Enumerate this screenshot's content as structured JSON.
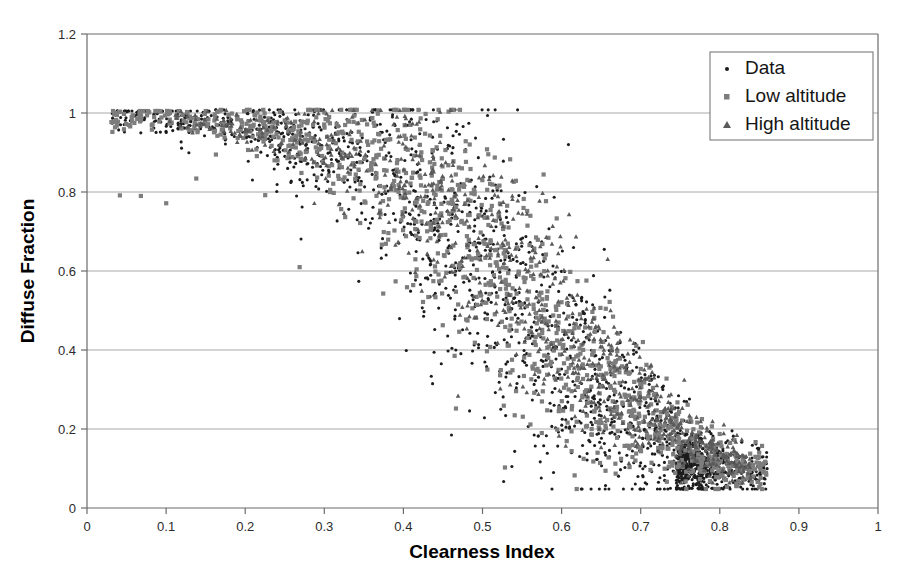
{
  "chart_data": {
    "type": "scatter",
    "title": "",
    "xlabel": "Clearness Index",
    "ylabel": "Diffuse Fraction",
    "xlim": [
      0,
      1
    ],
    "ylim": [
      0,
      1.2
    ],
    "xticks": [
      "0",
      "0.1",
      "0.2",
      "0.3",
      "0.4",
      "0.5",
      "0.6",
      "0.7",
      "0.8",
      "0.9",
      "1"
    ],
    "xtick_values": [
      0,
      0.1,
      0.2,
      0.3,
      0.4,
      0.5,
      0.6,
      0.7,
      0.8,
      0.9,
      1
    ],
    "yticks": [
      "0",
      "0.2",
      "0.4",
      "0.6",
      "0.8",
      "1",
      "1.2"
    ],
    "ytick_values": [
      0,
      0.2,
      0.4,
      0.6,
      0.8,
      1,
      1.2
    ],
    "grid": "horizontal",
    "legend_position": "top-right",
    "series": [
      {
        "name": "Data",
        "marker": "dot",
        "color": "#1c1c1c",
        "size": 3.1,
        "count": 1450,
        "description": "Measured hourly diffuse fraction versus clearness index; broad scatter band decaying from ~1.0 at low clearness index to ~0.08 at high clearness index.",
        "x_range": [
          0.03,
          0.86
        ],
        "y_range": [
          0.05,
          1.01
        ]
      },
      {
        "name": "Low altitude",
        "marker": "square",
        "color": "#7d7d7d",
        "size": 4.2,
        "count": 1250,
        "description": "Low solar altitude subset; sits slightly above the main trend at mid clearness index.",
        "x_range": [
          0.03,
          0.86
        ],
        "y_range": [
          0.06,
          1.01
        ]
      },
      {
        "name": "High altitude",
        "marker": "triangle",
        "color": "#5a5a5a",
        "size": 4.6,
        "count": 780,
        "description": "High solar altitude subset; concentrated at mid-to-high clearness index with elevated diffuse fraction.",
        "x_range": [
          0.06,
          0.84
        ],
        "y_range": [
          0.07,
          1.01
        ]
      }
    ],
    "trend": {
      "description": "Sigmoidal decline: diffuse fraction near 1.0 for KT below 0.2, knee near KT 0.45-0.55, asymptote near 0.08-0.12 for KT above 0.75",
      "knots_x": [
        0.03,
        0.1,
        0.18,
        0.25,
        0.32,
        0.4,
        0.48,
        0.55,
        0.62,
        0.7,
        0.78,
        0.84
      ],
      "knots_y": [
        0.99,
        0.99,
        0.97,
        0.94,
        0.89,
        0.8,
        0.66,
        0.5,
        0.34,
        0.21,
        0.12,
        0.09
      ]
    }
  },
  "legend": {
    "entries": [
      {
        "label": "Data",
        "marker": "dot"
      },
      {
        "label": "Low altitude",
        "marker": "square"
      },
      {
        "label": "High altitude",
        "marker": "triangle"
      }
    ]
  },
  "axes": {
    "x_title": "Clearness Index",
    "y_title": "Diffuse Fraction"
  },
  "colors": {
    "data": "#1c1c1c",
    "low_altitude": "#7d7d7d",
    "high_altitude": "#5a5a5a",
    "grid": "#a8a8a8",
    "frame": "#6b6b6b",
    "background": "#ffffff"
  }
}
